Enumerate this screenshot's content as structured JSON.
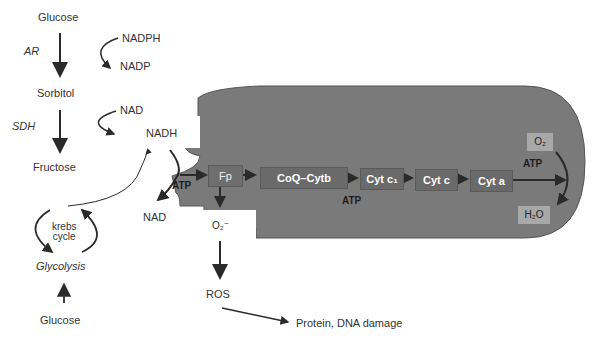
{
  "polyol_pathway": {
    "glucose_top": "Glucose",
    "enzyme_ar": "AR",
    "cofactor_nadph": "NADPH",
    "cofactor_nadp": "NADP",
    "sorbitol": "Sorbitol",
    "enzyme_sdh": "SDH",
    "cofactor_nad": "NAD",
    "fructose": "Fructose"
  },
  "glycolysis": {
    "krebs_cycle": "krebs\ncycle",
    "glycolysis": "Glycolysis",
    "glucose_bottom": "Glucose"
  },
  "mitochondrion": {
    "nadh": "NADH",
    "nad": "NAD",
    "atp_left": "ATP",
    "atp_middle": "ATP",
    "atp_right": "ATP",
    "chain": [
      "Fp",
      "CoQ–Cytb",
      "Cyt c₁",
      "Cyt c",
      "Cyt a"
    ],
    "o2": "O₂",
    "h2o": "H₂O",
    "superoxide": "O₂⁻"
  },
  "outcomes": {
    "ros": "ROS",
    "damage": "Protein, DNA damage"
  },
  "colors": {
    "mitochondrion_fill": "#7a7a7a",
    "chain_box": "#6a6a6a",
    "light_box": "#a8a8a8",
    "arrow": "#2a2a2a"
  }
}
